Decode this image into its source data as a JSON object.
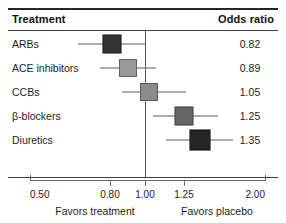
{
  "table": {
    "col_treatment": "Treatment",
    "col_odds_ratio": "Odds ratio"
  },
  "footer": {
    "left": "Favors treatment",
    "right": "Favors placebo"
  },
  "chart_data": {
    "type": "forest",
    "title": "",
    "xlabel": "Odds ratio",
    "ylabel": "",
    "scale": "log",
    "xlim": [
      0.5,
      2.0
    ],
    "null_value": 1.0,
    "grid": false,
    "legend": "none",
    "tick_labels": [
      "0.50",
      "0.80",
      "1.00",
      "1.25",
      "2.00"
    ],
    "tick_values": [
      0.5,
      0.8,
      1.0,
      1.25,
      2.0
    ],
    "categories": [
      "ARBs",
      "ACE inhibitors",
      "CCBs",
      "β-blockers",
      "Diuretics"
    ],
    "values": [
      0.82,
      0.89,
      1.05,
      1.25,
      1.35
    ],
    "value_labels": [
      "0.82",
      "0.89",
      "1.05",
      "1.25",
      "1.35"
    ],
    "rows": [
      {
        "label": "ARBs",
        "estimate": 0.82,
        "estimate_label": "0.82",
        "ci_low": 0.68,
        "ci_high": 1.0,
        "marker_color": "#333333",
        "marker_size": 19,
        "px": {
          "center": 112,
          "line_left": 78,
          "line_right": 145,
          "row_top": 2
        }
      },
      {
        "label": "ACE inhibitors",
        "estimate": 0.89,
        "estimate_label": "0.89",
        "ci_low": 0.74,
        "ci_high": 1.06,
        "marker_color": "#999999",
        "marker_size": 18,
        "px": {
          "center": 128,
          "line_left": 100,
          "line_right": 156,
          "row_top": 26
        }
      },
      {
        "label": "CCBs",
        "estimate": 1.05,
        "estimate_label": "1.05",
        "ci_low": 0.85,
        "ci_high": 1.3,
        "marker_color": "#8a8a8a",
        "marker_size": 18,
        "px": {
          "center": 149,
          "line_left": 122,
          "line_right": 186,
          "row_top": 50
        }
      },
      {
        "label": "β-blockers",
        "estimate": 1.25,
        "estimate_label": "1.25",
        "ci_low": 1.03,
        "ci_high": 1.53,
        "marker_color": "#666666",
        "marker_size": 19,
        "px": {
          "center": 184,
          "line_left": 153,
          "line_right": 218,
          "row_top": 74
        }
      },
      {
        "label": "Diuretics",
        "estimate": 1.35,
        "estimate_label": "1.35",
        "ci_low": 1.12,
        "ci_high": 1.62,
        "marker_color": "#262626",
        "marker_size": 21,
        "px": {
          "center": 200,
          "line_left": 166,
          "line_right": 233,
          "row_top": 98
        }
      }
    ],
    "axis_px": {
      "left": 30,
      "right": 265,
      "ticks": [
        30,
        110,
        145,
        184,
        265
      ]
    },
    "footer_px": {
      "left": 95,
      "right": 217
    }
  },
  "colors": {
    "ink": "#1d1d1d",
    "rule": "#262626",
    "axis": "#6a6b6f"
  }
}
